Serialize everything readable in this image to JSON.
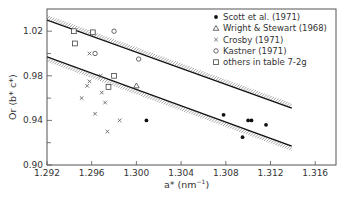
{
  "chart_data": {
    "type": "scatter",
    "title": "",
    "xlabel": "a* (nm⁻¹)",
    "ylabel": "Or (b* c*)",
    "xlim": [
      1.292,
      1.3176
    ],
    "ylim": [
      0.9,
      1.0413
    ],
    "x_ticks": [
      "1.292",
      "1.296",
      "1.300",
      "1.304",
      "1.308",
      "1.312",
      "1.316"
    ],
    "x_tick_values": [
      1.292,
      1.296,
      1.3,
      1.304,
      1.308,
      1.312,
      1.316
    ],
    "y_ticks": [
      "0.90",
      "0.94",
      "0.98",
      "1.02"
    ],
    "y_tick_values": [
      0.9,
      0.94,
      0.98,
      1.02
    ],
    "y_minor_tick_values": [
      0.92,
      0.96,
      1.0
    ],
    "grid": false,
    "legend_position": "upper-right",
    "series": [
      {
        "name": "Scott et al. (1971)",
        "marker": "filled-circle",
        "points": [
          [
            1.3009,
            0.94
          ],
          [
            1.3078,
            0.945
          ],
          [
            1.31,
            0.94
          ],
          [
            1.3103,
            0.94
          ],
          [
            1.3116,
            0.936
          ],
          [
            1.3095,
            0.925
          ]
        ]
      },
      {
        "name": "Wright & Stewart (1968)",
        "marker": "triangle",
        "points": [
          [
            1.3,
            0.971
          ]
        ]
      },
      {
        "name": "Crosby (1971)",
        "marker": "cross",
        "points": [
          [
            1.2958,
            1.0
          ],
          [
            1.2968,
            0.98
          ],
          [
            1.2958,
            0.975
          ],
          [
            1.2956,
            0.971
          ],
          [
            1.2969,
            0.965
          ],
          [
            1.2951,
            0.96
          ],
          [
            1.2972,
            0.956
          ],
          [
            1.2963,
            0.946
          ],
          [
            1.2985,
            0.94
          ],
          [
            1.2974,
            0.93
          ]
        ]
      },
      {
        "name": "Kastner (1971)",
        "marker": "open-circle",
        "points": [
          [
            1.298,
            1.02
          ],
          [
            1.2963,
            1.0
          ],
          [
            1.3002,
            0.995
          ]
        ]
      },
      {
        "name": "others in table 7-2g",
        "marker": "open-square",
        "points": [
          [
            1.2944,
            1.02
          ],
          [
            1.2961,
            1.019
          ],
          [
            1.2945,
            1.009
          ],
          [
            1.298,
            0.98
          ],
          [
            1.2975,
            0.97
          ]
        ]
      }
    ],
    "lines": [
      {
        "name": "upper-bound-line",
        "x": [
          1.292,
          1.3139
        ],
        "y": [
          1.03,
          0.951
        ],
        "hatch": "above"
      },
      {
        "name": "lower-bound-line",
        "x": [
          1.292,
          1.3139
        ],
        "y": [
          0.997,
          0.917
        ],
        "hatch": "below"
      }
    ]
  },
  "axes": {
    "xlabel_main": "a*",
    "xlabel_unit": " (nm",
    "xlabel_sup": "−1",
    "xlabel_close": ")",
    "ylabel": "Or (b* c*)"
  },
  "legend": [
    {
      "symbol": "●",
      "label": "Scott et al. (1971)"
    },
    {
      "symbol": "△",
      "label": "Wright & Stewart (1968)"
    },
    {
      "symbol": "×",
      "label": "Crosby (1971)"
    },
    {
      "symbol": "o",
      "label": "Kastner (1971)"
    },
    {
      "symbol": "□",
      "label": "others in table 7-2g"
    }
  ]
}
